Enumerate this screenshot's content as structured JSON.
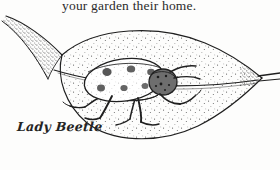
{
  "page": {
    "width": 280,
    "height": 170,
    "background_color": "#fdfdfc",
    "ink_color": "#1f1f1f"
  },
  "body_text": {
    "line": "your garden their home."
  },
  "caption": {
    "label": "Lady Beetle"
  },
  "illustration": {
    "subject": "lady-beetle-on-leaf",
    "medium": "pen-and-ink stipple drawing",
    "leaf": {
      "name": "leaf",
      "stem_direction": "upper-left",
      "tip_direction": "right",
      "has_midrib_vein": true,
      "texture": "stippled"
    },
    "beetle": {
      "name": "lady-beetle",
      "spot_count": 6,
      "leg_count": 6,
      "antenna_count": 2,
      "facing": "right"
    }
  }
}
